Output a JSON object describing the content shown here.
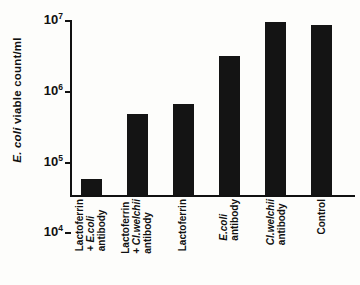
{
  "chart_data": {
    "type": "bar",
    "title": "",
    "xlabel": "",
    "ylabel": "E.coli viable count/ml",
    "ylabel_italic_part": "E. coli",
    "ylabel_rest": " viable count/ml",
    "yscale": "log",
    "ylim": [
      1000,
      10000000
    ],
    "grid": false,
    "legend": "none",
    "ytick_labels": [
      "10⁷",
      "10⁶",
      "10⁵",
      "10⁴",
      "10⁳"
    ],
    "ytick_values": [
      10000000,
      1000000,
      100000,
      10000,
      1000
    ],
    "ytick_mantissa": [
      "10",
      "10",
      "10",
      "10",
      "10"
    ],
    "ytick_exponents": [
      "7",
      "6",
      "5",
      "4",
      "3"
    ],
    "categories": [
      "Lactoferrin + E.coli antibody",
      "Lactoferrin + Cl.welchii antibody",
      "Lactoferrin",
      "E.coli antibody",
      "Cl.welchii antibody",
      "Control"
    ],
    "category_lines": [
      [
        "Lactoferrin",
        "+ E.coli",
        "antibody"
      ],
      [
        "Lactoferrin",
        "+ Cl.welchii",
        "antibody"
      ],
      [
        "Lactoferrin"
      ],
      [
        "E.coli",
        "antibody"
      ],
      [
        "Cl.welchii",
        "antibody"
      ],
      [
        "Control"
      ]
    ],
    "category_italic_lines": [
      [
        false,
        true,
        false
      ],
      [
        false,
        true,
        false
      ],
      [
        false
      ],
      [
        true,
        false
      ],
      [
        true,
        false
      ],
      [
        false
      ]
    ],
    "values": [
      2300,
      70000,
      120000,
      1500000,
      9000000,
      7500000
    ],
    "value_labels": [
      "2.3 × 10³",
      "7 × 10⁴",
      "1.2 × 10⁵",
      "1.5 × 10⁶",
      "9 × 10⁶",
      "7.5 × 10⁶"
    ],
    "bar_color": "#141414",
    "axis_color": "#111111",
    "background_color": "#fdfdfb"
  }
}
